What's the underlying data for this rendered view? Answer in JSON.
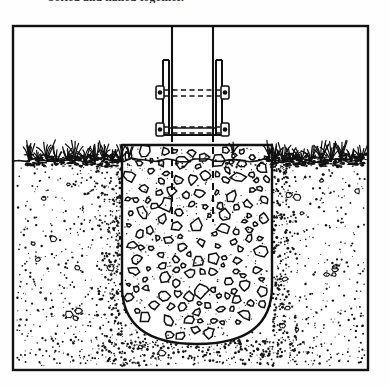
{
  "caption": {
    "text": "bolted and nailed together."
  },
  "figure": {
    "name": "post-footing-cross-section",
    "frame": {
      "x": 11,
      "y": 24,
      "width": 359,
      "height": 348,
      "stroke": "#111111",
      "stroke_width": 2.2
    },
    "colors": {
      "ink": "#111111",
      "paper": "#fefefe",
      "soil_stipple": "#1a1a1a",
      "hidden_line": "#111111"
    },
    "grade_line_y": 135,
    "parts": [
      {
        "name": "wood-post",
        "label": "post",
        "x_left": 161,
        "x_right": 202,
        "top": 0,
        "bottom": 111
      },
      {
        "name": "post-bracket",
        "label": "steel bracket",
        "x_left": 152,
        "x_right": 211,
        "top": 36,
        "bottom": 111
      },
      {
        "name": "upper-bolt",
        "label": "bolt",
        "y": 68
      },
      {
        "name": "lower-bolt",
        "label": "bolt",
        "y": 106
      },
      {
        "name": "concrete-footing",
        "label": "concrete footing",
        "x_left": 111,
        "x_right": 261,
        "top": 121,
        "bottom": 320,
        "bottom_radius": 58
      },
      {
        "name": "hidden-post-below-grade",
        "label": "buried post (hidden)",
        "bottom": 198
      },
      {
        "name": "soil",
        "label": "soil / earth"
      },
      {
        "name": "grass",
        "label": "grass at grade"
      }
    ]
  }
}
